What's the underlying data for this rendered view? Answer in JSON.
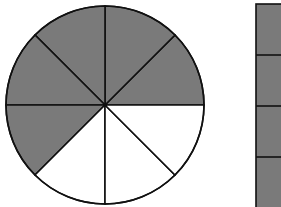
{
  "figure": {
    "colors": {
      "shaded": "#7a7a7a",
      "unshaded": "#ffffff",
      "stroke": "#111111"
    },
    "circle": {
      "cx": 105,
      "cy": 105,
      "r": 99,
      "sectors_total": 8,
      "sectors_shaded": 5,
      "shaded_flags": [
        true,
        true,
        true,
        true,
        true,
        false,
        false,
        false
      ]
    },
    "bar": {
      "x": 256,
      "y": 4,
      "width": 30,
      "height": 206,
      "parts_visible": 4,
      "divider_ys": [
        55,
        106,
        157
      ]
    }
  }
}
